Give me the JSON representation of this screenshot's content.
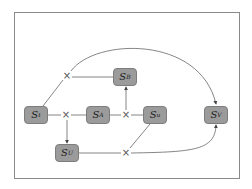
{
  "diagram": {
    "nodes": [
      {
        "id": "St",
        "base": "S",
        "sub": "t",
        "x": 36,
        "y": 115
      },
      {
        "id": "SA",
        "base": "S",
        "sub": "A",
        "x": 98,
        "y": 115
      },
      {
        "id": "SB",
        "base": "S",
        "sub": "B",
        "x": 125,
        "y": 77
      },
      {
        "id": "Su",
        "base": "S",
        "sub": "u",
        "x": 155,
        "y": 115
      },
      {
        "id": "SV",
        "base": "S",
        "sub": "V",
        "x": 216,
        "y": 115
      },
      {
        "id": "SU",
        "base": "S",
        "sub": "U",
        "x": 67,
        "y": 153
      }
    ],
    "product_markers": [
      {
        "id": "x1",
        "symbol": "×",
        "x": 67,
        "y": 76
      },
      {
        "id": "x2",
        "symbol": "×",
        "x": 66,
        "y": 115
      },
      {
        "id": "x3",
        "symbol": "×",
        "x": 126,
        "y": 115
      },
      {
        "id": "x4",
        "symbol": "×",
        "x": 126,
        "y": 153
      }
    ],
    "edges": [
      {
        "from": "St",
        "to": "x1",
        "arrow": false
      },
      {
        "from": "x1",
        "to": "SB",
        "arrow": false
      },
      {
        "from": "x1",
        "to": "SV",
        "arrow": true,
        "curved": true
      },
      {
        "from": "St",
        "to": "x2",
        "arrow": false
      },
      {
        "from": "x2",
        "to": "SA",
        "arrow": false
      },
      {
        "from": "x2",
        "to": "SU",
        "arrow": true
      },
      {
        "from": "SA",
        "to": "x3",
        "arrow": false
      },
      {
        "from": "x3",
        "to": "Su",
        "arrow": false
      },
      {
        "from": "x3",
        "to": "SB",
        "arrow": true
      },
      {
        "from": "SU",
        "to": "x4",
        "arrow": false
      },
      {
        "from": "Su",
        "to": "x4",
        "arrow": false
      },
      {
        "from": "x4",
        "to": "SV",
        "arrow": true,
        "curved": true
      }
    ],
    "colors": {
      "node_fill": "#9b9b9b",
      "edge": "#666666",
      "frame": "#8a8a8a"
    }
  }
}
